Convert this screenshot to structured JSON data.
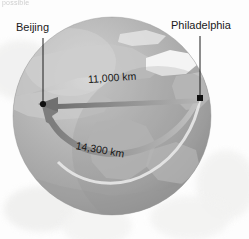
{
  "figure": {
    "type": "globe-distance-diagram",
    "clipped_header_text": "possible",
    "background_color": "#ffffff"
  },
  "globe": {
    "name": "earth-globe",
    "center_x": 112,
    "center_y": 116,
    "radius": 99,
    "ocean_color": "#a8a8a8",
    "land_color": "#cfcfcf",
    "ice_color": "#f2f2f2",
    "highlight_color": "#d9d9d9",
    "shadow_color": "#8f8f8f"
  },
  "cities": [
    {
      "id": "beijing",
      "label": "Beijing",
      "label_x": 16,
      "label_y": 21,
      "dot_x": 43,
      "dot_y": 104,
      "leader_from_y": 38,
      "leader_x": 43
    },
    {
      "id": "philadelphia",
      "label": "Philadelphia",
      "label_x": 171,
      "label_y": 19,
      "dot_x": 200,
      "dot_y": 98,
      "leader_from_y": 36,
      "leader_x": 200
    }
  ],
  "routes": [
    {
      "id": "short-route",
      "label": "11,000 km",
      "value": 11000,
      "unit": "km",
      "direction": "Philadelphia to Beijing",
      "description": "great-circle polar route",
      "arrow_color": "#8c8c8c",
      "label_x": 88,
      "label_y": 73
    },
    {
      "id": "long-route",
      "label": "14,300 km",
      "value": 14300,
      "unit": "km",
      "direction": "Philadelphia to Beijing",
      "description": "equatorial southern route",
      "arrow_color": "#9a9a9a",
      "label_x": 76,
      "label_y": 139
    }
  ]
}
